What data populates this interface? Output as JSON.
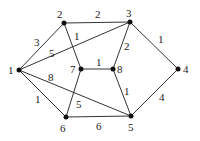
{
  "graph": {
    "nodes": [
      {
        "id": "1",
        "label": "1",
        "x": 19,
        "y": 70,
        "lx": 8,
        "ly": 74
      },
      {
        "id": "2",
        "label": "2",
        "x": 64,
        "y": 23,
        "lx": 57,
        "ly": 18
      },
      {
        "id": "3",
        "label": "3",
        "x": 130,
        "y": 22,
        "lx": 126,
        "ly": 17
      },
      {
        "id": "4",
        "label": "4",
        "x": 178,
        "y": 69,
        "lx": 183,
        "ly": 73
      },
      {
        "id": "5",
        "label": "5",
        "x": 131,
        "y": 116,
        "lx": 128,
        "ly": 131
      },
      {
        "id": "6",
        "label": "6",
        "x": 66,
        "y": 117,
        "lx": 60,
        "ly": 132
      },
      {
        "id": "7",
        "label": "7",
        "x": 81,
        "y": 69,
        "lx": 70,
        "ly": 73
      },
      {
        "id": "8",
        "label": "8",
        "x": 113,
        "y": 69,
        "lx": 117,
        "ly": 73
      }
    ],
    "edges": [
      {
        "from": "1",
        "to": "2",
        "weight": "3",
        "wx": 34,
        "wy": 46
      },
      {
        "from": "1",
        "to": "3",
        "weight": "5",
        "wx": 49,
        "wy": 57
      },
      {
        "from": "1",
        "to": "5",
        "weight": "8",
        "wx": 48,
        "wy": 81
      },
      {
        "from": "1",
        "to": "6",
        "weight": "1",
        "wx": 35,
        "wy": 103
      },
      {
        "from": "2",
        "to": "3",
        "weight": "2",
        "wx": 95,
        "wy": 18
      },
      {
        "from": "2",
        "to": "7",
        "weight": "1",
        "wx": 74,
        "wy": 40
      },
      {
        "from": "3",
        "to": "8",
        "weight": "2",
        "wx": 124,
        "wy": 50
      },
      {
        "from": "3",
        "to": "4",
        "weight": "1",
        "wx": 158,
        "wy": 43
      },
      {
        "from": "7",
        "to": "8",
        "weight": "1",
        "wx": 96,
        "wy": 66
      },
      {
        "from": "8",
        "to": "5",
        "weight": "1",
        "wx": 124,
        "wy": 95
      },
      {
        "from": "4",
        "to": "5",
        "weight": "4",
        "wx": 159,
        "wy": 101
      },
      {
        "from": "6",
        "to": "5",
        "weight": "6",
        "wx": 96,
        "wy": 130
      },
      {
        "from": "6",
        "to": "7",
        "weight": "5",
        "wx": 76,
        "wy": 108
      }
    ]
  }
}
